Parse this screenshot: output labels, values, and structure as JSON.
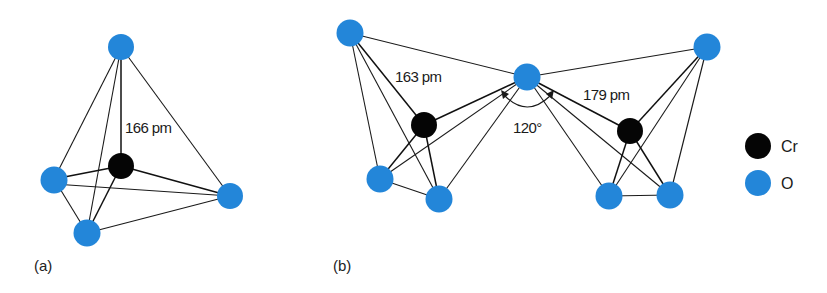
{
  "colors": {
    "oxygen": "#2386d9",
    "chromium": "#050505",
    "bond": "#1a1a1a"
  },
  "panel_a": {
    "label": "(a)",
    "bond_length_label": "166 pm",
    "atoms": [
      {
        "id": "O_top",
        "element": "O",
        "x": 121,
        "y": 47
      },
      {
        "id": "Cr",
        "element": "Cr",
        "x": 121,
        "y": 166
      },
      {
        "id": "O_left",
        "element": "O",
        "x": 54,
        "y": 179
      },
      {
        "id": "O_bottom",
        "element": "O",
        "x": 87,
        "y": 233
      },
      {
        "id": "O_right",
        "element": "O",
        "x": 230,
        "y": 196
      }
    ]
  },
  "panel_b": {
    "label": "(b)",
    "bond_length_terminal_label": "163 pm",
    "bond_length_bridging_label": "179 pm",
    "bridge_angle_label": "120°",
    "atoms": [
      {
        "id": "O_tl",
        "element": "O",
        "x": 350,
        "y": 33
      },
      {
        "id": "O_bridge",
        "element": "O",
        "x": 527,
        "y": 77
      },
      {
        "id": "Cr_left",
        "element": "Cr",
        "x": 424,
        "y": 125
      },
      {
        "id": "O_lbl",
        "element": "O",
        "x": 380,
        "y": 179
      },
      {
        "id": "O_lbr",
        "element": "O",
        "x": 439,
        "y": 199
      },
      {
        "id": "Cr_right",
        "element": "Cr",
        "x": 630,
        "y": 131
      },
      {
        "id": "O_tr",
        "element": "O",
        "x": 707,
        "y": 47
      },
      {
        "id": "O_rbl",
        "element": "O",
        "x": 609,
        "y": 196
      },
      {
        "id": "O_rbr",
        "element": "O",
        "x": 670,
        "y": 195
      }
    ]
  },
  "legend": {
    "items": [
      {
        "symbol": "Cr",
        "label": "Cr"
      },
      {
        "symbol": "O",
        "label": "O"
      }
    ]
  }
}
